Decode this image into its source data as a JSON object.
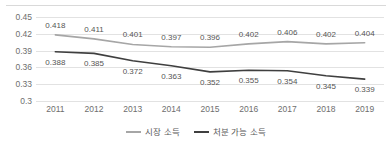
{
  "chart_data": {
    "type": "line",
    "title": "",
    "xlabel": "",
    "ylabel": "",
    "categories": [
      "2011",
      "2012",
      "2013",
      "2014",
      "2015",
      "2016",
      "2017",
      "2018",
      "2019"
    ],
    "yticks": [
      "0.45",
      "0.42",
      "0.39",
      "0.36",
      "0.33",
      "0.3"
    ],
    "ylim": [
      0.3,
      0.45
    ],
    "grid": true,
    "legend_position": "bottom",
    "series": [
      {
        "name": "시장 소득",
        "color": "#a6a6a6",
        "values": [
          0.418,
          0.411,
          0.401,
          0.397,
          0.396,
          0.402,
          0.406,
          0.402,
          0.404
        ],
        "labels": [
          "0.418",
          "0.411",
          "0.401",
          "0.397",
          "0.396",
          "0.402",
          "0.406",
          "0.402",
          "0.404"
        ]
      },
      {
        "name": "처분 가능 소득",
        "color": "#3f3f3f",
        "values": [
          0.388,
          0.385,
          0.372,
          0.363,
          0.352,
          0.355,
          0.354,
          0.345,
          0.339
        ],
        "labels": [
          "0.388",
          "0.385",
          "0.372",
          "0.363",
          "0.352",
          "0.355",
          "0.354",
          "0.345",
          "0.339"
        ]
      }
    ]
  }
}
